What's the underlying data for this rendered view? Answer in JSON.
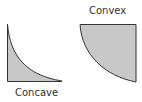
{
  "figures": [
    {
      "id": "concave",
      "label": "Concave"
    },
    {
      "id": "convex",
      "label": "Convex"
    }
  ],
  "colors": {
    "fill": "#c8c8c8",
    "stroke": "#333333",
    "text": "#333333"
  }
}
